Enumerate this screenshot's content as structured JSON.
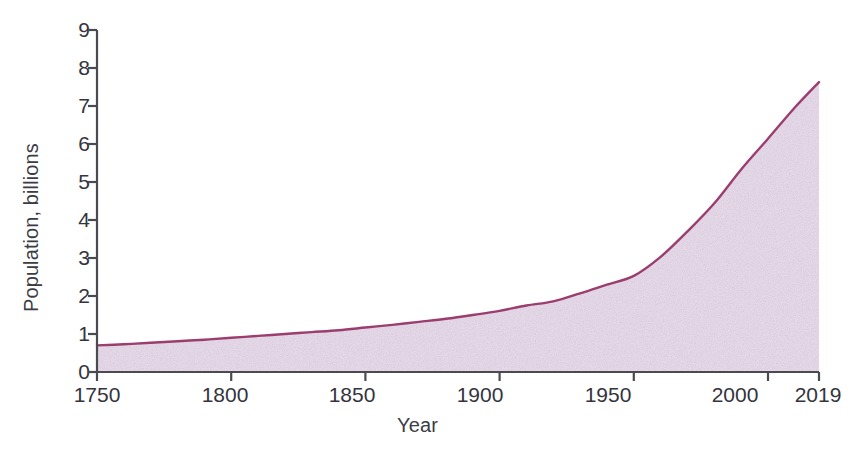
{
  "chart_data": {
    "type": "area",
    "title": "",
    "xlabel": "Year",
    "ylabel": "Population, billions",
    "xlim": [
      1750,
      2019
    ],
    "ylim": [
      0,
      9
    ],
    "grid": false,
    "legend": null,
    "x_ticks": [
      "1750",
      "1800",
      "1850",
      "1900",
      "1950",
      "2000",
      "2019"
    ],
    "x_tick_values": [
      1750,
      1800,
      1850,
      1900,
      1950,
      2000,
      2019
    ],
    "y_ticks": [
      "0",
      "1",
      "2",
      "3",
      "4",
      "5",
      "6",
      "7",
      "8",
      "9"
    ],
    "y_tick_values": [
      0,
      1,
      2,
      3,
      4,
      5,
      6,
      7,
      8,
      9
    ],
    "x": [
      1750,
      1760,
      1770,
      1780,
      1790,
      1800,
      1810,
      1820,
      1830,
      1840,
      1850,
      1860,
      1870,
      1880,
      1890,
      1900,
      1910,
      1920,
      1930,
      1940,
      1950,
      1960,
      1970,
      1980,
      1990,
      2000,
      2010,
      2019
    ],
    "values": [
      0.7,
      0.73,
      0.77,
      0.81,
      0.85,
      0.9,
      0.95,
      1.0,
      1.05,
      1.1,
      1.17,
      1.24,
      1.32,
      1.4,
      1.5,
      1.61,
      1.75,
      1.86,
      2.07,
      2.3,
      2.53,
      3.03,
      3.7,
      4.44,
      5.33,
      6.14,
      6.96,
      7.63
    ],
    "series": [
      {
        "name": "World population",
        "line_color": "#9b3d6e",
        "fill_color": "#e9dcec",
        "values": [
          0.7,
          0.73,
          0.77,
          0.81,
          0.85,
          0.9,
          0.95,
          1.0,
          1.05,
          1.1,
          1.17,
          1.24,
          1.32,
          1.4,
          1.5,
          1.61,
          1.75,
          1.86,
          2.07,
          2.3,
          2.53,
          3.03,
          3.7,
          4.44,
          5.33,
          6.14,
          6.96,
          7.63
        ]
      }
    ],
    "colors": {
      "line": "#9b3d6e",
      "fill": "#e9dcec",
      "axis": "#4a4a52",
      "text": "#34343d",
      "background": "#ffffff"
    }
  }
}
